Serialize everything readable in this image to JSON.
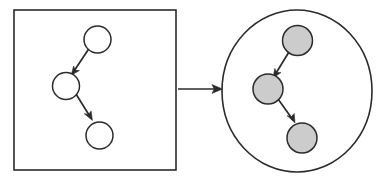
{
  "diagram": {
    "canvas": {
      "width": 389,
      "height": 181,
      "background": "#ffffff"
    },
    "colors": {
      "stroke": "#2b2b2b",
      "node_fill_plain": "#ffffff",
      "node_fill_shaded": "#cccccc",
      "background": "#ffffff"
    },
    "panels": [
      {
        "name": "source-panel",
        "shape": "square",
        "x": 14,
        "y": 10,
        "width": 162,
        "height": 160,
        "fill": "#ffffff",
        "stroke": "#2b2b2b"
      },
      {
        "name": "target-panel",
        "shape": "ellipse",
        "cx": 297,
        "cy": 91,
        "rx": 75,
        "ry": 81,
        "fill": "#ffffff",
        "stroke": "#2b2b2b"
      }
    ],
    "source_graph": {
      "name": "source-graph",
      "node_style": "unfilled",
      "nodes": [
        {
          "id": "s1",
          "label": "",
          "cx": 97.5,
          "cy": 39.5,
          "r": 13.5,
          "fill": "#ffffff"
        },
        {
          "id": "s2",
          "label": "",
          "cx": 66.0,
          "cy": 86.0,
          "r": 13.5,
          "fill": "#ffffff"
        },
        {
          "id": "s3",
          "label": "",
          "cx": 99.5,
          "cy": 135.5,
          "r": 13.5,
          "fill": "#ffffff"
        }
      ],
      "edges": [
        {
          "from": "s1",
          "to": "s2",
          "directed": true
        },
        {
          "from": "s2",
          "to": "s3",
          "directed": true
        }
      ]
    },
    "target_graph": {
      "name": "target-graph",
      "node_style": "shaded",
      "nodes": [
        {
          "id": "t1",
          "label": "",
          "cx": 297.5,
          "cy": 40.5,
          "r": 15.0,
          "fill": "#cccccc"
        },
        {
          "id": "t2",
          "label": "",
          "cx": 268.0,
          "cy": 89.0,
          "r": 15.0,
          "fill": "#cccccc"
        },
        {
          "id": "t3",
          "label": "",
          "cx": 302.0,
          "cy": 138.0,
          "r": 15.0,
          "fill": "#cccccc"
        }
      ],
      "edges": [
        {
          "from": "t1",
          "to": "t2",
          "directed": true
        },
        {
          "from": "t2",
          "to": "t3",
          "directed": true
        }
      ]
    },
    "transform_arrow": {
      "name": "transform-arrow",
      "label": "",
      "x1": 178,
      "y1": 89,
      "x2": 222,
      "y2": 89,
      "directed": true
    }
  }
}
